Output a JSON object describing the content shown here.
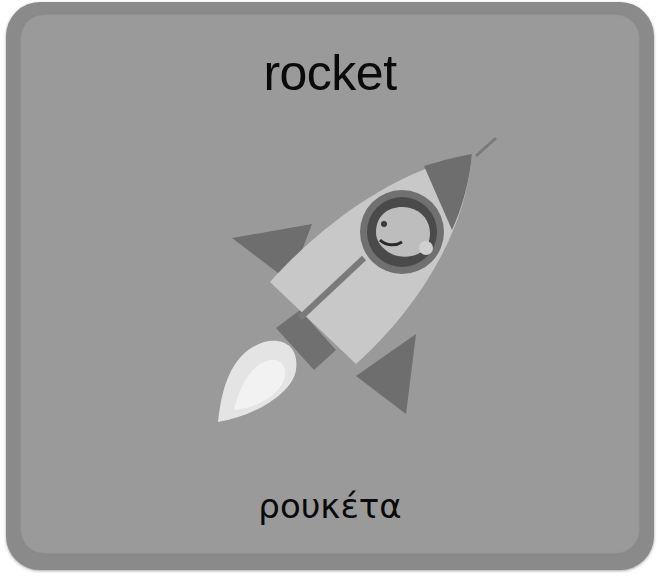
{
  "card": {
    "word_english": "rocket",
    "word_greek": "ρουκέτα",
    "illustration": "rocket-icon",
    "colors": {
      "card_border": "#8a8a8a",
      "card_face": "#9a9a9a",
      "text": "#0a0a0a",
      "rocket_body": "#c8c8c8",
      "rocket_fins": "#6e6e6e",
      "flame": "#e6e6e6"
    }
  }
}
